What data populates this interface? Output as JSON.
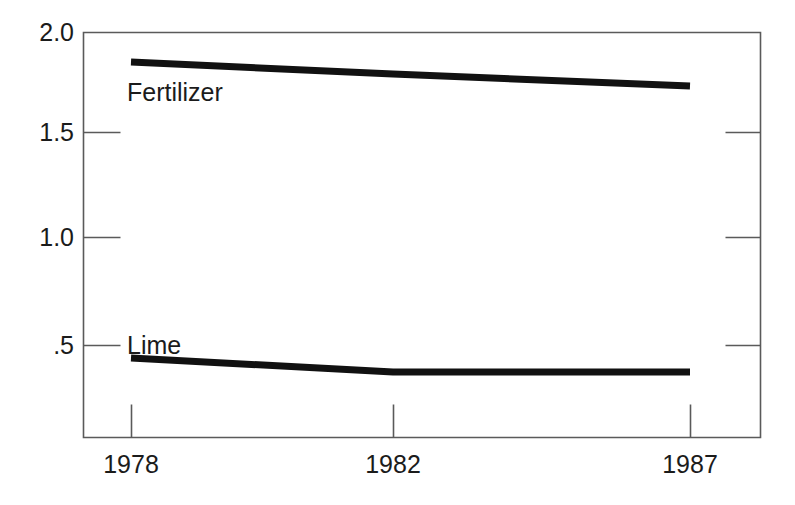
{
  "chart_data": {
    "type": "line",
    "title": "",
    "subtitle": "",
    "xlabel": "",
    "ylabel": "",
    "x": [
      1978,
      1982,
      1987
    ],
    "categories": [
      "1978",
      "1982",
      "1987"
    ],
    "series": [
      {
        "name": "Fertilizer",
        "values": [
          1.85,
          1.79,
          1.73
        ]
      },
      {
        "name": "Lime",
        "values": [
          0.37,
          0.3,
          0.3
        ]
      }
    ],
    "xlim": [
      1976.2,
      1994.5
    ],
    "ylim": [
      0.05,
      2.0
    ],
    "ytick_values": [
      2.0,
      1.5,
      1.0,
      0.5
    ],
    "ytick_labels": [
      "2.0",
      "1.5",
      "1.0",
      ".5"
    ],
    "xtick_values": [
      1978,
      1982,
      1987
    ],
    "xtick_labels": [
      "1978",
      "1982",
      "1987"
    ],
    "grid": false,
    "legend": "inline-series-labels",
    "line_color": "#111111",
    "axis_color": "#555555",
    "background_color": "#ffffff"
  },
  "annotations": {
    "fertilizer_label": "Fertilizer",
    "lime_label": "Lime"
  },
  "axes": {
    "ytick_labels": [
      "2.0",
      "1.5",
      "1.0",
      ".5"
    ],
    "xtick_labels": [
      "1978",
      "1982",
      "1987"
    ]
  }
}
